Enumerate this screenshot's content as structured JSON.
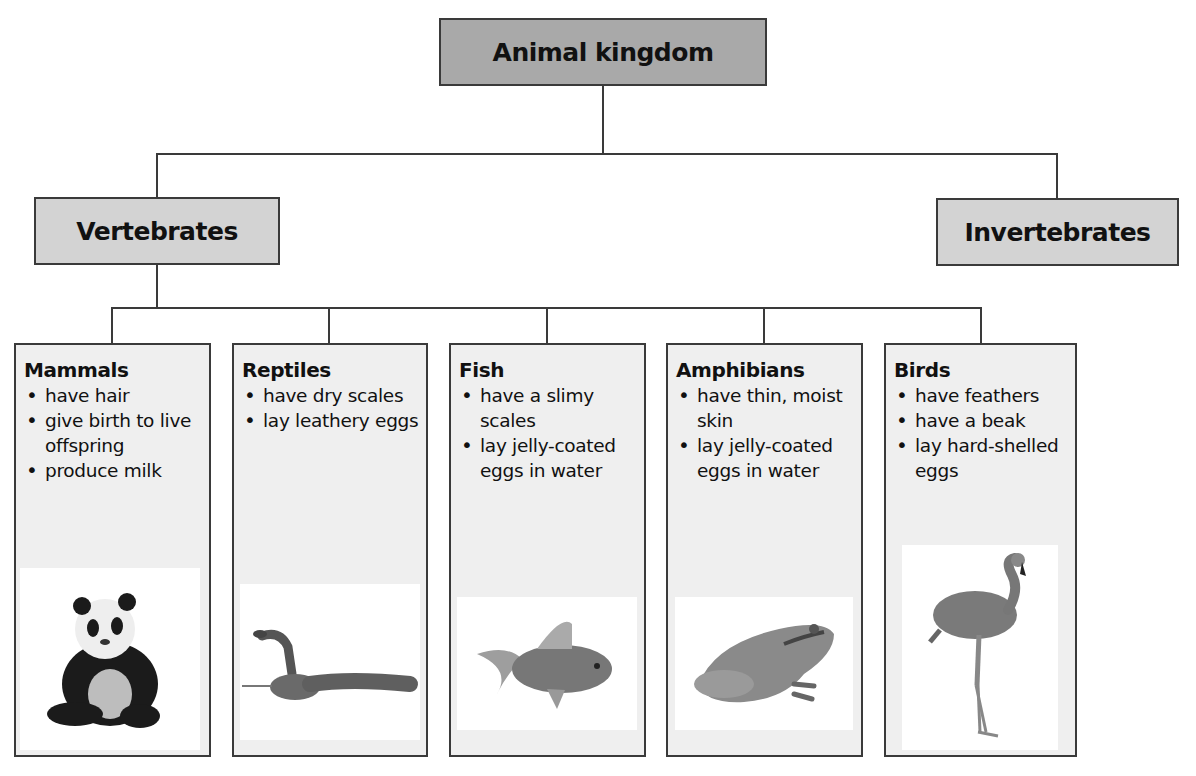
{
  "diagram": {
    "root": {
      "label": "Animal kingdom"
    },
    "branches": [
      {
        "label": "Vertebrates"
      },
      {
        "label": "Invertebrates"
      }
    ],
    "groups": [
      {
        "title": "Mammals",
        "traits": [
          "have hair",
          "give birth to live offspring",
          "produce milk"
        ],
        "image": "panda-photo"
      },
      {
        "title": "Reptiles",
        "traits": [
          "have dry scales",
          "lay leathery eggs"
        ],
        "image": "snake-photo"
      },
      {
        "title": "Fish",
        "traits": [
          "have a slimy scales",
          "lay jelly-coated eggs in water"
        ],
        "image": "goldfish-photo"
      },
      {
        "title": "Amphibians",
        "traits": [
          "have thin, moist skin",
          "lay jelly-coated eggs in water"
        ],
        "image": "frog-photo"
      },
      {
        "title": "Birds",
        "traits": [
          "have feathers",
          "have a beak",
          "lay hard-shelled eggs"
        ],
        "image": "flamingo-photo"
      }
    ],
    "colors": {
      "root_fill": "#a9a9a9",
      "branch_fill": "#d3d3d3",
      "card_fill": "#efefef",
      "line": "#3a3a3a"
    }
  }
}
